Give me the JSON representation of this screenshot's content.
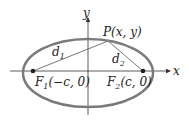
{
  "diagram": {
    "type": "ellipse-foci",
    "axes": {
      "x_label": "x",
      "y_label": "y"
    },
    "point": {
      "label": "P(x, y)"
    },
    "foci": [
      {
        "label_main": "F",
        "label_sub": "1",
        "label_coords": "(−c, 0)"
      },
      {
        "label_main": "F",
        "label_sub": "2",
        "label_coords": "(c, 0)"
      }
    ],
    "distances": [
      {
        "main": "d",
        "sub": "1"
      },
      {
        "main": "d",
        "sub": "2"
      }
    ],
    "colors": {
      "ellipse": "#7a7a7a",
      "axes": "#333333",
      "lines": "#555555"
    }
  }
}
